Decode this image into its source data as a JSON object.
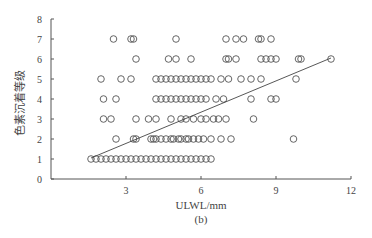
{
  "chart_data": {
    "type": "scatter",
    "title": "",
    "subtitle": "(b)",
    "xlabel": "ULWL/mm",
    "ylabel": "色素沉着等级",
    "xlim": [
      0,
      12
    ],
    "ylim": [
      0,
      8
    ],
    "xticks": [
      3,
      6,
      9,
      12
    ],
    "yticks": [
      0,
      1,
      2,
      3,
      4,
      5,
      6,
      7,
      8
    ],
    "grid": false,
    "legend": null,
    "marker": "open-circle",
    "series": [
      {
        "name": "observations",
        "points": [
          [
            1.6,
            1
          ],
          [
            1.8,
            1
          ],
          [
            2.0,
            1
          ],
          [
            2.2,
            1
          ],
          [
            2.4,
            1
          ],
          [
            2.6,
            1
          ],
          [
            2.8,
            1
          ],
          [
            3.0,
            1
          ],
          [
            3.2,
            1
          ],
          [
            3.4,
            1
          ],
          [
            3.6,
            1
          ],
          [
            3.8,
            1
          ],
          [
            4.0,
            1
          ],
          [
            4.2,
            1
          ],
          [
            4.4,
            1
          ],
          [
            4.6,
            1
          ],
          [
            4.8,
            1
          ],
          [
            5.0,
            1
          ],
          [
            5.2,
            1
          ],
          [
            5.4,
            1
          ],
          [
            5.6,
            1
          ],
          [
            5.8,
            1
          ],
          [
            6.0,
            1
          ],
          [
            6.2,
            1
          ],
          [
            6.4,
            1
          ],
          [
            2.6,
            2
          ],
          [
            3.3,
            2
          ],
          [
            3.4,
            2
          ],
          [
            4.0,
            2
          ],
          [
            4.1,
            2
          ],
          [
            4.2,
            2
          ],
          [
            4.4,
            2
          ],
          [
            4.6,
            2
          ],
          [
            4.8,
            2
          ],
          [
            4.9,
            2
          ],
          [
            5.1,
            2
          ],
          [
            5.2,
            2
          ],
          [
            5.4,
            2
          ],
          [
            5.5,
            2
          ],
          [
            5.7,
            2
          ],
          [
            5.9,
            2
          ],
          [
            6.1,
            2
          ],
          [
            6.4,
            2
          ],
          [
            6.8,
            2
          ],
          [
            7.2,
            2
          ],
          [
            9.7,
            2
          ],
          [
            2.1,
            3
          ],
          [
            2.4,
            3
          ],
          [
            3.4,
            3
          ],
          [
            3.9,
            3
          ],
          [
            4.2,
            3
          ],
          [
            4.8,
            3
          ],
          [
            5.2,
            3
          ],
          [
            5.4,
            3
          ],
          [
            5.7,
            3
          ],
          [
            6.0,
            3
          ],
          [
            6.2,
            3
          ],
          [
            6.5,
            3
          ],
          [
            6.7,
            3
          ],
          [
            7.0,
            3
          ],
          [
            8.1,
            3
          ],
          [
            2.1,
            4
          ],
          [
            2.6,
            4
          ],
          [
            4.2,
            4
          ],
          [
            4.4,
            4
          ],
          [
            4.6,
            4
          ],
          [
            4.8,
            4
          ],
          [
            5.0,
            4
          ],
          [
            5.2,
            4
          ],
          [
            5.4,
            4
          ],
          [
            5.6,
            4
          ],
          [
            5.8,
            4
          ],
          [
            6.0,
            4
          ],
          [
            6.2,
            4
          ],
          [
            6.6,
            4
          ],
          [
            6.9,
            4
          ],
          [
            8.0,
            4
          ],
          [
            8.8,
            4
          ],
          [
            9.0,
            4
          ],
          [
            2.0,
            5
          ],
          [
            2.8,
            5
          ],
          [
            3.2,
            5
          ],
          [
            4.2,
            5
          ],
          [
            4.4,
            5
          ],
          [
            4.6,
            5
          ],
          [
            4.8,
            5
          ],
          [
            5.0,
            5
          ],
          [
            5.2,
            5
          ],
          [
            5.4,
            5
          ],
          [
            5.6,
            5
          ],
          [
            5.8,
            5
          ],
          [
            6.0,
            5
          ],
          [
            6.2,
            5
          ],
          [
            6.4,
            5
          ],
          [
            6.8,
            5
          ],
          [
            7.1,
            5
          ],
          [
            7.6,
            5
          ],
          [
            8.0,
            5
          ],
          [
            8.4,
            5
          ],
          [
            9.8,
            5
          ],
          [
            3.4,
            6
          ],
          [
            4.7,
            6
          ],
          [
            5.0,
            6
          ],
          [
            5.6,
            6
          ],
          [
            7.0,
            6
          ],
          [
            7.1,
            6
          ],
          [
            7.4,
            6
          ],
          [
            8.4,
            6
          ],
          [
            8.6,
            6
          ],
          [
            8.8,
            6
          ],
          [
            9.0,
            6
          ],
          [
            9.9,
            6
          ],
          [
            10.0,
            6
          ],
          [
            11.2,
            6
          ],
          [
            2.5,
            7
          ],
          [
            3.2,
            7
          ],
          [
            3.3,
            7
          ],
          [
            5.0,
            7
          ],
          [
            7.0,
            7
          ],
          [
            7.4,
            7
          ],
          [
            7.7,
            7
          ],
          [
            8.3,
            7
          ],
          [
            8.4,
            7
          ],
          [
            8.8,
            7
          ]
        ]
      }
    ],
    "trendline": {
      "x": [
        1.6,
        11.2
      ],
      "y": [
        1.05,
        6.05
      ]
    }
  },
  "colors": {
    "marker": "#555555",
    "axis": "#555555",
    "line": "#444444"
  }
}
